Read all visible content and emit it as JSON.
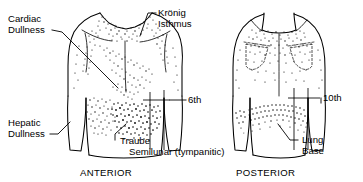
{
  "figure": {
    "background_color": "#ffffff",
    "ink_color": "#000000",
    "panels": [
      {
        "id": "anterior",
        "caption": "ANTERIOR",
        "caption_x": 80,
        "caption_y": 176
      },
      {
        "id": "posterior",
        "caption": "POSTERIOR",
        "caption_x": 236,
        "caption_y": 176
      }
    ],
    "labels": [
      {
        "id": "cardiac-dullness",
        "lines": [
          "Cardiac",
          "Dullness"
        ],
        "x": 8,
        "y": 22,
        "anchor": "start",
        "panel": "anterior"
      },
      {
        "id": "kronig-isthmus",
        "lines": [
          "Krönig",
          "Isthmus"
        ],
        "x": 158,
        "y": 16,
        "anchor": "start",
        "panel": "anterior"
      },
      {
        "id": "sixth-rib",
        "lines": [
          "6th"
        ],
        "x": 188,
        "y": 103,
        "anchor": "start",
        "panel": "anterior"
      },
      {
        "id": "hepatic-dullness",
        "lines": [
          "Hepatic",
          "Dullness"
        ],
        "x": 8,
        "y": 126,
        "anchor": "start",
        "panel": "anterior"
      },
      {
        "id": "traube-semilunar",
        "lines": [
          "Traube",
          "Semilunar (tympanitic)"
        ],
        "x": 117,
        "y": 144,
        "anchor": "start",
        "panel": "anterior"
      },
      {
        "id": "tenth-rib",
        "lines": [
          "10th"
        ],
        "x": 323,
        "y": 101,
        "anchor": "start",
        "panel": "posterior"
      },
      {
        "id": "lung-base",
        "lines": [
          "Lung",
          "Base"
        ],
        "x": 300,
        "y": 143,
        "anchor": "start",
        "panel": "posterior"
      }
    ],
    "percussion_zones": [
      {
        "id": "kronig-isthmus-zone",
        "panel": "anterior",
        "description": "Dense stipple over supraclavicular neck and apices",
        "density": "dense"
      },
      {
        "id": "cardiac-dullness-zone",
        "panel": "anterior",
        "description": "Diagonal stipple band over precordium",
        "density": "medium"
      },
      {
        "id": "hepatic-dullness-zone",
        "panel": "anterior",
        "description": "Stipple over right lower chest / liver",
        "density": "medium"
      },
      {
        "id": "traube-space-zone",
        "panel": "anterior",
        "description": "Very dense stipple over left lower chest, tympanitic semilunar space",
        "density": "very-dense"
      },
      {
        "id": "apices-zone-posterior",
        "panel": "posterior",
        "description": "Stipple over upper back and scapular apices",
        "density": "medium"
      },
      {
        "id": "lung-base-zone-posterior",
        "panel": "posterior",
        "description": "Curved stipple band across posterior lung bases",
        "density": "medium"
      }
    ]
  }
}
